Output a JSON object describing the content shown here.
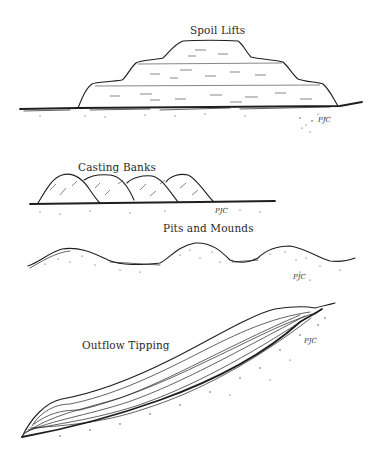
{
  "figure": {
    "panels": [
      {
        "id": "spoil-lifts",
        "label": "Spoil Lifts",
        "signature": "PJC"
      },
      {
        "id": "casting-banks",
        "label": "Casting Banks",
        "signature": "PJC"
      },
      {
        "id": "pits-and-mounds",
        "label": "Pits and Mounds",
        "signature": "PJC"
      },
      {
        "id": "outflow-tipping",
        "label": "Outflow Tipping",
        "signature": "PJC"
      }
    ]
  }
}
